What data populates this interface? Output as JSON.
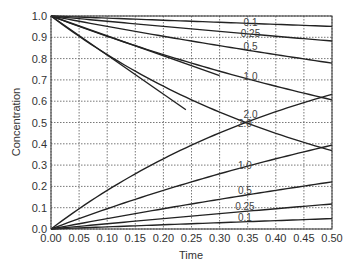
{
  "chart_data": {
    "type": "line",
    "title": "",
    "xlabel": "Time",
    "ylabel": "Concentration",
    "xlim": [
      0,
      0.5
    ],
    "ylim": [
      0,
      1.0
    ],
    "grid": true,
    "grid_style": "dotted",
    "legend": "inline labels",
    "x_ticks": [
      "0.00",
      "0.05",
      "0.10",
      "0.15",
      "0.20",
      "0.25",
      "0.30",
      "0.35",
      "0.40",
      "0.45",
      "0.50"
    ],
    "y_ticks": [
      "0.0",
      "0.1",
      "0.2",
      "0.3",
      "0.4",
      "0.5",
      "0.6",
      "0.7",
      "0.8",
      "0.9",
      "1.0"
    ],
    "series": [
      {
        "name": "0.1 (decay)",
        "label": "0.1",
        "x": [
          0,
          0.5
        ],
        "values": [
          1.0,
          0.951
        ],
        "shape": "exp",
        "k": 0.1
      },
      {
        "name": "0.25 (decay)",
        "label": "0.25",
        "x": [
          0,
          0.5
        ],
        "values": [
          1.0,
          0.882
        ],
        "shape": "exp",
        "k": 0.25
      },
      {
        "name": "0.5 (decay)",
        "label": "0.5",
        "x": [
          0,
          0.5
        ],
        "values": [
          1.0,
          0.779
        ],
        "shape": "exp",
        "k": 0.5
      },
      {
        "name": "1.0 (decay)",
        "label": "1.0",
        "x": [
          0,
          0.5
        ],
        "values": [
          1.0,
          0.607
        ],
        "shape": "exp",
        "k": 1.0
      },
      {
        "name": "2.0 (decay)",
        "label": "2.0",
        "x": [
          0,
          0.5
        ],
        "values": [
          1.0,
          0.368
        ],
        "shape": "exp",
        "k": 2.0
      },
      {
        "name": "1.0 (initial tangent)",
        "label": "",
        "x": [
          0,
          0.3
        ],
        "values": [
          1.0,
          0.72
        ],
        "shape": "linear"
      },
      {
        "name": "2.0 (initial tangent)",
        "label": "",
        "x": [
          0,
          0.24
        ],
        "values": [
          1.0,
          0.56
        ],
        "shape": "linear"
      },
      {
        "name": "2.0 (growth)",
        "label": "2.0",
        "x": [
          0,
          0.5
        ],
        "values": [
          0.0,
          0.632
        ],
        "shape": "rise",
        "k": 2.0
      },
      {
        "name": "1.0 (growth)",
        "label": "1.0",
        "x": [
          0,
          0.5
        ],
        "values": [
          0.0,
          0.393
        ],
        "shape": "rise",
        "k": 1.0
      },
      {
        "name": "0.5 (growth)",
        "label": "0.5",
        "x": [
          0,
          0.5
        ],
        "values": [
          0.0,
          0.221
        ],
        "shape": "rise",
        "k": 0.5
      },
      {
        "name": "0.25 (growth)",
        "label": "0.25",
        "x": [
          0,
          0.5
        ],
        "values": [
          0.0,
          0.118
        ],
        "shape": "rise",
        "k": 0.25
      },
      {
        "name": "0.1 (growth)",
        "label": "0.1",
        "x": [
          0,
          0.5
        ],
        "values": [
          0.0,
          0.049
        ],
        "shape": "rise",
        "k": 0.1
      }
    ],
    "annotations": [
      {
        "text": "0.1",
        "x": 0.355,
        "y": 0.965
      },
      {
        "text": "0.25",
        "x": 0.355,
        "y": 0.915
      },
      {
        "text": "0.5",
        "x": 0.355,
        "y": 0.855
      },
      {
        "text": "1.0",
        "x": 0.355,
        "y": 0.715
      },
      {
        "text": "2.0",
        "x": 0.355,
        "y": 0.535
      },
      {
        "text": "2.0",
        "x": 0.345,
        "y": 0.495
      },
      {
        "text": "1.0",
        "x": 0.345,
        "y": 0.295
      },
      {
        "text": "0.5",
        "x": 0.345,
        "y": 0.18
      },
      {
        "text": "0.25",
        "x": 0.345,
        "y": 0.105
      },
      {
        "text": "0.1",
        "x": 0.345,
        "y": 0.052
      }
    ]
  }
}
